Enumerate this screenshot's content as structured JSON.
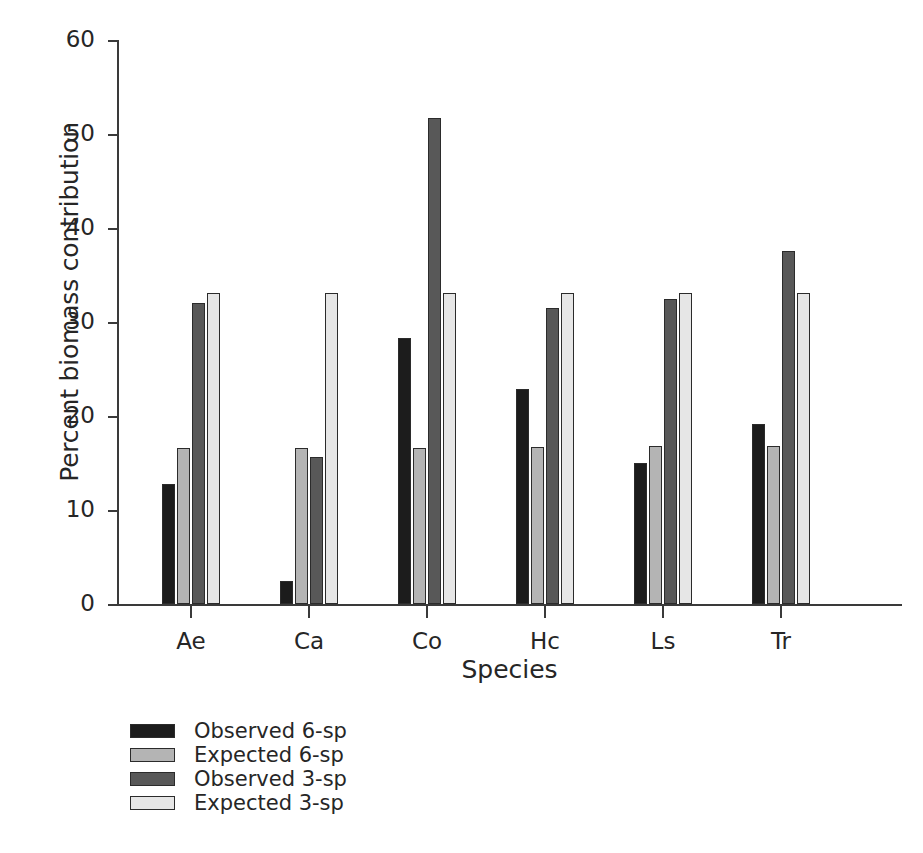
{
  "chart_data": {
    "type": "bar",
    "title": "",
    "xlabel": "Species",
    "ylabel": "Percent biomass contribution",
    "categories": [
      "Ae",
      "Ca",
      "Co",
      "Hc",
      "Ls",
      "Tr"
    ],
    "ylim": [
      0,
      60
    ],
    "yticks": [
      0,
      10,
      20,
      30,
      40,
      50,
      60
    ],
    "grid": false,
    "legend_position": "below-left",
    "series": [
      {
        "name": "Observed 6-sp",
        "color": "#1c1c1c",
        "values": [
          12.8,
          2.4,
          28.3,
          22.9,
          15.0,
          19.2
        ]
      },
      {
        "name": "Expected 6-sp",
        "color": "#b4b4b4",
        "values": [
          16.6,
          16.6,
          16.6,
          16.7,
          16.8,
          16.8
        ]
      },
      {
        "name": "Observed 3-sp",
        "color": "#585858",
        "values": [
          32.0,
          15.6,
          51.7,
          31.5,
          32.4,
          37.6
        ]
      },
      {
        "name": "Expected 3-sp",
        "color": "#e6e6e6",
        "values": [
          33.1,
          33.1,
          33.1,
          33.1,
          33.1,
          33.1
        ]
      }
    ]
  },
  "axes": {
    "ytick_labels": [
      "0",
      "10",
      "20",
      "30",
      "40",
      "50",
      "60"
    ],
    "xtick_labels": [
      "Ae",
      "Ca",
      "Co",
      "Hc",
      "Ls",
      "Tr"
    ],
    "xlabel": "Species",
    "ylabel": "Percent biomass contribution"
  },
  "legend": {
    "items": [
      {
        "label": "Observed 6-sp",
        "color": "#1c1c1c"
      },
      {
        "label": "Expected 6-sp",
        "color": "#b4b4b4"
      },
      {
        "label": "Observed 3-sp",
        "color": "#585858"
      },
      {
        "label": "Expected 3-sp",
        "color": "#e6e6e6"
      }
    ]
  }
}
